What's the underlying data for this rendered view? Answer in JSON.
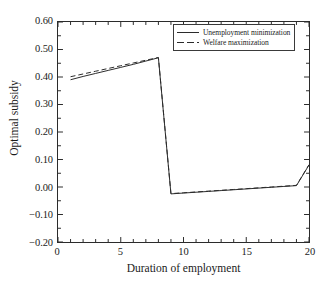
{
  "chart_data": {
    "type": "line",
    "title": "",
    "xlabel": "Duration of employment",
    "ylabel": "Optimal subsidy",
    "xlim": [
      0,
      20
    ],
    "ylim": [
      -0.2,
      0.6
    ],
    "xticks": [
      0,
      5,
      10,
      15,
      20
    ],
    "xtick_labels": [
      "0",
      "5",
      "10",
      "15",
      "20"
    ],
    "yticks": [
      -0.2,
      -0.1,
      0.0,
      0.1,
      0.2,
      0.3,
      0.4,
      0.5,
      0.6
    ],
    "ytick_labels": [
      "-0.20",
      "-0.10",
      "0.00",
      "0.10",
      "0.20",
      "0.30",
      "0.40",
      "0.50",
      "0.60"
    ],
    "xminor_step": 1,
    "yminor_step": 0.05,
    "grid": false,
    "legend_position": "top-right",
    "x": [
      1,
      2,
      3,
      4,
      5,
      6,
      7,
      8,
      9,
      10,
      11,
      12,
      13,
      14,
      15,
      16,
      17,
      18,
      19,
      20
    ],
    "series": [
      {
        "name": "Unemployment minimization",
        "style": "solid",
        "color": "#2b2b2b",
        "values": [
          0.39,
          0.402,
          0.413,
          0.424,
          0.435,
          0.446,
          0.458,
          0.47,
          -0.025,
          -0.022,
          -0.019,
          -0.016,
          -0.013,
          -0.01,
          -0.007,
          -0.004,
          -0.001,
          0.002,
          0.005,
          0.08
        ]
      },
      {
        "name": "Welfare maximization",
        "style": "dashed",
        "color": "#2b2b2b",
        "values": [
          0.401,
          0.411,
          0.421,
          0.431,
          0.441,
          0.451,
          0.461,
          0.471,
          -0.024,
          -0.021,
          -0.018,
          -0.015,
          -0.012,
          -0.009,
          -0.006,
          -0.003,
          0.0,
          0.003,
          0.006,
          0.081
        ]
      }
    ]
  },
  "legend": {
    "entries": [
      {
        "label": "Unemployment minimization"
      },
      {
        "label": "Welfare maximization"
      }
    ]
  }
}
